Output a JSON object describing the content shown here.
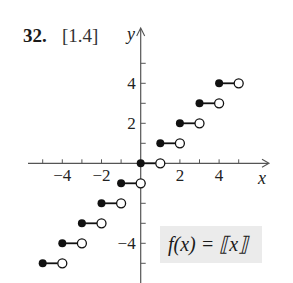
{
  "header": {
    "problem_number": "32.",
    "section_ref": "[1.4]"
  },
  "formula": "f(x) = ⟦x⟧",
  "chart_data": {
    "type": "line",
    "subtype": "step-function",
    "xlabel": "x",
    "ylabel": "y",
    "xlim": [
      -5.5,
      6.5
    ],
    "ylim": [
      -5.5,
      6.5
    ],
    "x_tick_labels": [
      "-4",
      "-2",
      "2",
      "4"
    ],
    "y_tick_labels": [
      "4",
      "2",
      "-4"
    ],
    "x_ticks": [
      -5,
      -4,
      -3,
      -2,
      -1,
      1,
      2,
      3,
      4,
      5
    ],
    "y_ticks": [
      -5,
      -4,
      -3,
      -2,
      -1,
      1,
      2,
      3,
      4,
      5
    ],
    "grid": false,
    "legend": "none",
    "annotation": "f(x) = [[x]]",
    "segments": [
      {
        "x_start": -5,
        "x_end": -4,
        "y": -5,
        "start": "closed",
        "end": "open"
      },
      {
        "x_start": -4,
        "x_end": -3,
        "y": -4,
        "start": "closed",
        "end": "open"
      },
      {
        "x_start": -3,
        "x_end": -2,
        "y": -3,
        "start": "closed",
        "end": "open"
      },
      {
        "x_start": -2,
        "x_end": -1,
        "y": -2,
        "start": "closed",
        "end": "open"
      },
      {
        "x_start": -1,
        "x_end": 0,
        "y": -1,
        "start": "closed",
        "end": "open"
      },
      {
        "x_start": 0,
        "x_end": 1,
        "y": 0,
        "start": "closed",
        "end": "open"
      },
      {
        "x_start": 1,
        "x_end": 2,
        "y": 1,
        "start": "closed",
        "end": "open"
      },
      {
        "x_start": 2,
        "x_end": 3,
        "y": 2,
        "start": "closed",
        "end": "open"
      },
      {
        "x_start": 3,
        "x_end": 4,
        "y": 3,
        "start": "closed",
        "end": "open"
      },
      {
        "x_start": 4,
        "x_end": 5,
        "y": 4,
        "start": "closed",
        "end": "open"
      }
    ]
  }
}
